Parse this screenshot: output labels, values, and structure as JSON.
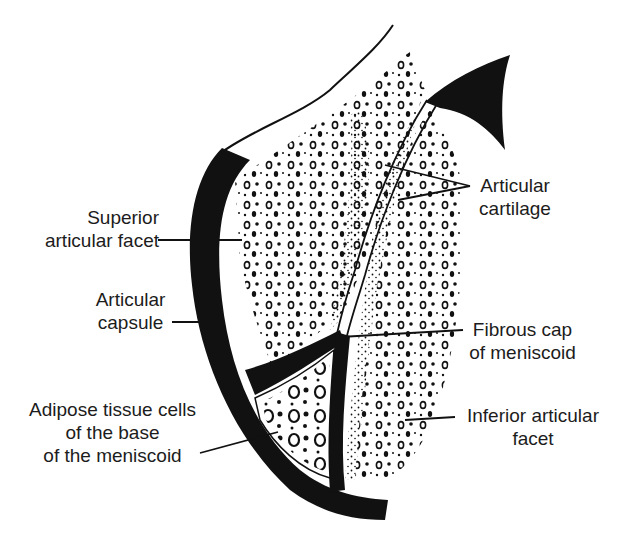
{
  "figure": {
    "colors": {
      "ink": "#111111",
      "background": "#ffffff"
    }
  },
  "labels": {
    "superior_articular_facet": {
      "line1": "Superior",
      "line2": "articular facet"
    },
    "articular_capsule": {
      "line1": "Articular",
      "line2": "capsule"
    },
    "adipose_tissue": {
      "line1": "Adipose tissue cells",
      "line2": "of the base",
      "line3": "of the meniscoid"
    },
    "articular_cartilage": {
      "line1": "Articular",
      "line2": "cartilage"
    },
    "fibrous_cap": {
      "line1": "Fibrous cap",
      "line2": "of meniscoid"
    },
    "inferior_articular_facet": {
      "line1": "Inferior articular",
      "line2": "facet"
    }
  }
}
